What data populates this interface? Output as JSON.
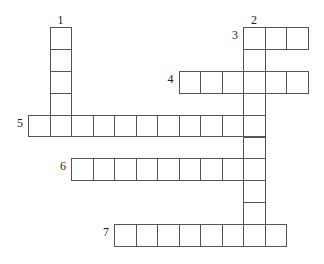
{
  "puzzle": {
    "type": "crossword",
    "grid": {
      "origin_x": 28,
      "origin_y": 27,
      "cell_w": 21.5,
      "cell_h": 21.9
    },
    "colors": {
      "border": "#555555",
      "cell": "#ffffff",
      "text": "#222222"
    },
    "entries": [
      {
        "number": "1",
        "direction": "down",
        "row": 0,
        "col": 1,
        "length": 5,
        "label_side": "top"
      },
      {
        "number": "2",
        "direction": "down",
        "row": 0,
        "col": 10,
        "length": 10,
        "label_side": "top"
      },
      {
        "number": "3",
        "direction": "across",
        "row": 0,
        "col": 10,
        "length": 3,
        "label_side": "left"
      },
      {
        "number": "4",
        "direction": "across",
        "row": 2,
        "col": 7,
        "length": 6,
        "label_side": "left"
      },
      {
        "number": "5",
        "direction": "across",
        "row": 4,
        "col": 0,
        "length": 11,
        "label_side": "left"
      },
      {
        "number": "6",
        "direction": "across",
        "row": 6,
        "col": 2,
        "length": 9,
        "label_side": "left"
      },
      {
        "number": "7",
        "direction": "across",
        "row": 9,
        "col": 4,
        "length": 8,
        "label_side": "left"
      }
    ]
  }
}
